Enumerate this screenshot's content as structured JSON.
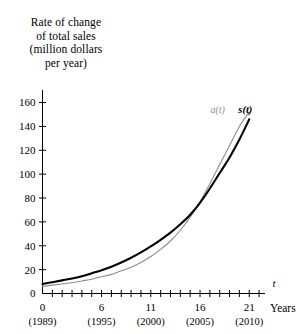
{
  "chart_data": {
    "type": "line",
    "title": "",
    "ylabel_lines": [
      "Rate of change",
      "of total sales",
      "(million dollars",
      "per year)"
    ],
    "ylabel": "Rate of change of total sales (million dollars per year)",
    "xlabel": "Years",
    "x_axis_variable": "t",
    "xlim": [
      0,
      22.6
    ],
    "ylim": [
      0,
      168
    ],
    "yticks": [
      0,
      20,
      40,
      60,
      80,
      100,
      120,
      140,
      160
    ],
    "ytick_labels": [
      "0",
      "20",
      "40",
      "60",
      "80",
      "100",
      "120",
      "140",
      "160"
    ],
    "xticks": [
      0,
      1,
      2,
      3,
      4,
      5,
      6,
      7,
      8,
      9,
      10,
      11,
      12,
      13,
      14,
      15,
      16,
      17,
      18,
      19,
      20,
      21,
      22
    ],
    "xtick_labels": [
      {
        "t": 0,
        "label": "0",
        "year": "(1989)"
      },
      {
        "t": 6,
        "label": "6",
        "year": "(1995)"
      },
      {
        "t": 11,
        "label": "11",
        "year": "(2000)"
      },
      {
        "t": 16,
        "label": "16",
        "year": "(2005)"
      },
      {
        "t": 21,
        "label": "21",
        "year": "(2010)"
      }
    ],
    "grid": false,
    "legend_position": "inline-curve-labels",
    "series": [
      {
        "name": "a(t)",
        "label": "a(t)",
        "color": "#8c8c8c",
        "width": 1.1,
        "x": [
          0,
          1,
          2,
          3,
          4,
          5,
          6,
          7,
          8,
          9,
          10,
          11,
          12,
          13,
          14,
          15,
          16,
          17,
          18,
          19,
          20,
          21
        ],
        "values": [
          6,
          7,
          8,
          9,
          10.5,
          12,
          14,
          16,
          19,
          22,
          26,
          31,
          37,
          44,
          53,
          64,
          77,
          92,
          108,
          124,
          140,
          152
        ]
      },
      {
        "name": "s(t)",
        "label": "s(t)",
        "color": "#000000",
        "width": 2.1,
        "x": [
          0,
          1,
          2,
          3,
          4,
          5,
          6,
          7,
          8,
          9,
          10,
          11,
          12,
          13,
          14,
          15,
          16,
          17,
          18,
          19,
          20,
          21
        ],
        "values": [
          8,
          9.5,
          11,
          12.5,
          14.5,
          17,
          19.5,
          22.5,
          26,
          30,
          34.5,
          39.5,
          45,
          51,
          58,
          66,
          76,
          88,
          101,
          114,
          129,
          146
        ]
      }
    ],
    "annotations": [
      {
        "text": "a(t)",
        "t": 17.8,
        "value": 151,
        "series": "a(t)"
      },
      {
        "text": "s(t)",
        "t": 20.6,
        "value": 151,
        "series": "s(t)"
      }
    ]
  }
}
